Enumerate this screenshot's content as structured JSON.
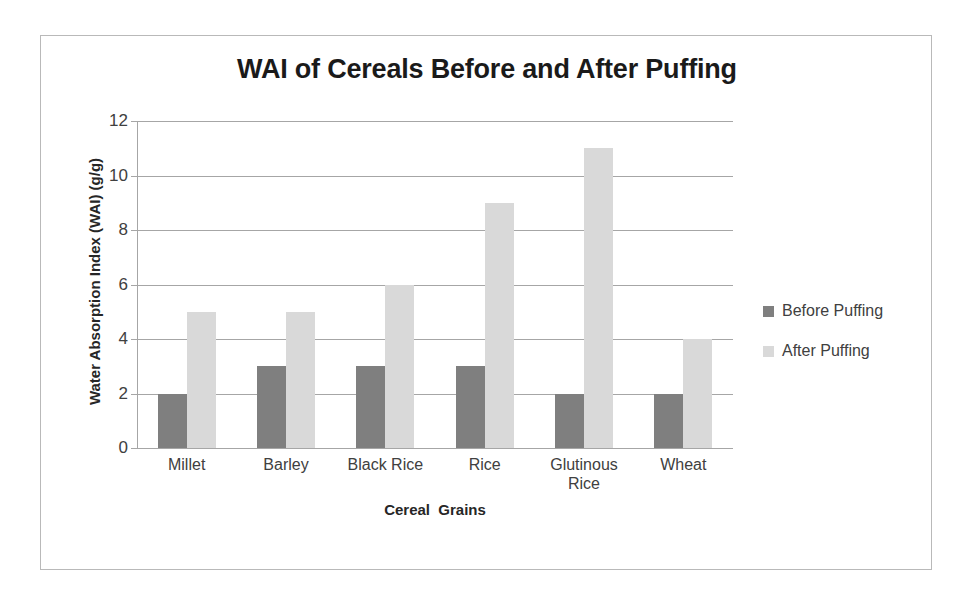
{
  "chart_data": {
    "type": "bar",
    "title": "WAI of Cereals Before and After Puffing",
    "xlabel": "Cereal  Grains",
    "ylabel": "Water Absorption Index (WAI) (g/g)",
    "categories": [
      "Millet",
      "Barley",
      "Black Rice",
      "Rice",
      "Glutinous Rice",
      "Wheat"
    ],
    "series": [
      {
        "name": "Before Puffing",
        "color": "#7f7f7f",
        "values": [
          2,
          3,
          3,
          3,
          2,
          2
        ]
      },
      {
        "name": "After Puffing",
        "color": "#d9d9d9",
        "values": [
          5,
          5,
          6,
          9,
          11,
          4
        ]
      }
    ],
    "ylim": [
      0,
      12
    ],
    "yticks": [
      0,
      2,
      4,
      6,
      8,
      10,
      12
    ],
    "ytick_labels": [
      "0",
      "2",
      "4",
      "6",
      "8",
      "10",
      "12"
    ],
    "grid": true,
    "legend_position": "right",
    "gridline_color": "#a6a6a6",
    "frame_color": "#b9b9b9",
    "background": "#ffffff"
  }
}
